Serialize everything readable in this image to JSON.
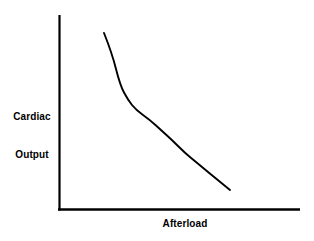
{
  "chart_data": {
    "type": "line",
    "title": "",
    "xlabel": "Afterload",
    "ylabel": "Cardiac\nOutput",
    "ylabel_lines": [
      "Cardiac",
      "Output"
    ],
    "grid": false,
    "legend": null,
    "axis_ticks": false,
    "tick_labels": {
      "x": [],
      "y": []
    },
    "xlim": [
      0,
      1
    ],
    "ylim": [
      0,
      1
    ],
    "line_color": "#000000",
    "axis_color": "#000000",
    "background_color": "#ffffff",
    "series": [
      {
        "name": "cardiac-output-vs-afterload",
        "description": "Convex decreasing curve: cardiac output falls steeply then flattens as afterload increases",
        "x": [
          0.19,
          0.24,
          0.29,
          0.34,
          0.38,
          0.43,
          0.49,
          0.55,
          0.62,
          0.68,
          0.75,
          0.82,
          0.89
        ],
        "y": [
          0.905,
          0.8,
          0.705,
          0.625,
          0.565,
          0.505,
          0.455,
          0.41,
          0.365,
          0.325,
          0.285,
          0.245,
          0.205
        ],
        "points_px": [
          [
            104,
            33
          ],
          [
            112,
            53
          ],
          [
            120,
            85
          ],
          [
            128,
            100
          ],
          [
            136,
            110
          ],
          [
            150,
            120
          ],
          [
            162,
            131
          ],
          [
            172,
            140
          ],
          [
            185,
            153
          ],
          [
            196,
            162
          ],
          [
            208,
            172
          ],
          [
            219,
            181
          ],
          [
            230,
            190
          ]
        ]
      }
    ]
  },
  "labels": {
    "y_axis_line1": "Cardiac",
    "y_axis_line2": "Output",
    "x_axis": "Afterload"
  }
}
